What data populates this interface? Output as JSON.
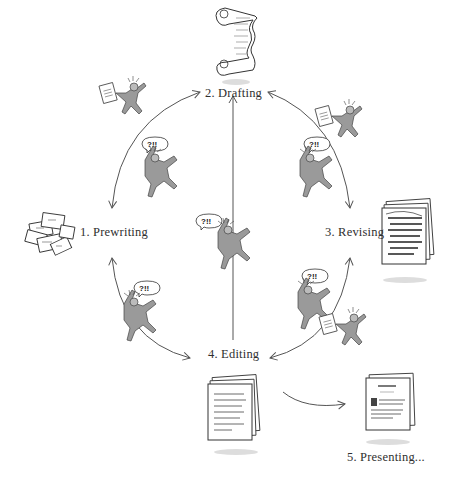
{
  "diagram": {
    "type": "cycle",
    "stages": [
      {
        "id": "prewriting",
        "label": "1. Prewriting",
        "icon": "scattered-notes-icon"
      },
      {
        "id": "drafting",
        "label": "2. Drafting",
        "icon": "scroll-icon"
      },
      {
        "id": "revising",
        "label": "3. Revising",
        "icon": "marked-up-pages-icon"
      },
      {
        "id": "editing",
        "label": "4. Editing",
        "icon": "handwritten-pages-icon"
      },
      {
        "id": "presenting",
        "label": "5. Presenting...",
        "icon": "final-document-icon"
      }
    ],
    "connections": [
      {
        "from": "prewriting",
        "to": "drafting",
        "bidirectional": true
      },
      {
        "from": "drafting",
        "to": "revising",
        "bidirectional": true
      },
      {
        "from": "revising",
        "to": "editing",
        "bidirectional": true
      },
      {
        "from": "editing",
        "to": "prewriting",
        "bidirectional": true
      },
      {
        "from": "editing",
        "to": "drafting",
        "bidirectional": false
      },
      {
        "from": "editing",
        "to": "presenting",
        "bidirectional": false
      }
    ],
    "figures": {
      "speech_bubble_text": "?!!",
      "count_tumbling": 5,
      "count_carrying_paper": 3
    }
  },
  "colors": {
    "line": "#555555",
    "figure_fill": "#9a9a9a",
    "text": "#2f2f2f",
    "shadow": "#cfcfcf"
  }
}
